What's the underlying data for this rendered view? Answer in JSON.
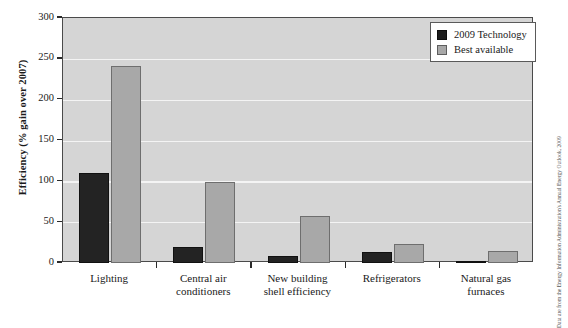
{
  "chart_data": {
    "type": "bar",
    "title": "",
    "xlabel": "",
    "ylabel": "Efficiency (% gain over 2007)",
    "ylim": [
      0,
      300
    ],
    "yticks": [
      0,
      50,
      100,
      150,
      200,
      250,
      300
    ],
    "ytick_labels": [
      "0",
      "50",
      "100",
      "150",
      "200",
      "250",
      "300"
    ],
    "grid": true,
    "legend_position": "top-right",
    "categories": [
      "Lighting",
      "Central air conditioners",
      "New building shell efficiency",
      "Refrigerators",
      "Natural gas furnaces"
    ],
    "category_lines": [
      [
        "Lighting"
      ],
      [
        "Central air",
        "conditioners"
      ],
      [
        "New building",
        "shell efficiency"
      ],
      [
        "Refrigerators"
      ],
      [
        "Natural gas",
        "furnaces"
      ]
    ],
    "series": [
      {
        "name": "2009 Technology",
        "color": "#232323",
        "values": [
          110,
          19,
          8,
          14,
          2
        ]
      },
      {
        "name": "Best available",
        "color": "#a8a8a8",
        "values": [
          241,
          99,
          58,
          23,
          15
        ]
      }
    ],
    "source_note": "Data are from the Energy Information Administration's Annual Energy Outlook, 2009",
    "plot_background": "#d5d5d5",
    "gridline_color": "#f4f4f4",
    "axis_color": "#4a4a4a"
  }
}
